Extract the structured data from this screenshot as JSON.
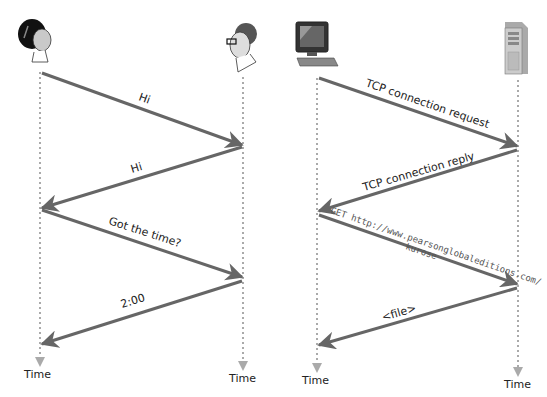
{
  "left_diagram": {
    "title": "Human protocol",
    "participants": [
      {
        "name": "woman",
        "icon": "woman-head-icon"
      },
      {
        "name": "man",
        "icon": "man-with-glasses-icon"
      }
    ],
    "messages": [
      {
        "label": "Hi",
        "from": "woman",
        "to": "man"
      },
      {
        "label": "Hi",
        "from": "man",
        "to": "woman"
      },
      {
        "label": "Got the time?",
        "from": "woman",
        "to": "man"
      },
      {
        "label": "2:00",
        "from": "man",
        "to": "woman"
      }
    ],
    "time_labels": [
      "Time",
      "Time"
    ]
  },
  "right_diagram": {
    "title": "Computer network protocol",
    "participants": [
      {
        "name": "client",
        "icon": "desktop-computer-icon"
      },
      {
        "name": "server",
        "icon": "server-tower-icon"
      }
    ],
    "messages": [
      {
        "label": "TCP connection request",
        "from": "client",
        "to": "server"
      },
      {
        "label": "TCP connection reply",
        "from": "server",
        "to": "client"
      },
      {
        "label": "GET http://www.pearsonglobaleditions.com/",
        "label2": "kurose",
        "from": "client",
        "to": "server"
      },
      {
        "label": "<file>",
        "from": "server",
        "to": "client"
      }
    ],
    "time_labels": [
      "Time",
      "Time"
    ]
  },
  "colors": {
    "arrow": "#666666",
    "lifeline": "#aaaaaa",
    "text": "#222222"
  }
}
